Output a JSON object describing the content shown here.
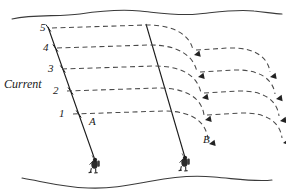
{
  "figure": {
    "current_label": "Current",
    "line_a_label": "A",
    "line_b_label": "B",
    "depth_marks": [
      {
        "label": "5",
        "x": 40,
        "y": 22
      },
      {
        "label": "4",
        "x": 43,
        "y": 42
      },
      {
        "label": "3",
        "x": 48,
        "y": 63
      },
      {
        "label": "2",
        "x": 53,
        "y": 85
      },
      {
        "label": "1",
        "x": 59,
        "y": 108
      }
    ],
    "label_positions": {
      "current": {
        "x": 4,
        "y": 78
      },
      "line_a": {
        "x": 89,
        "y": 116
      },
      "line_b": {
        "x": 203,
        "y": 134
      }
    },
    "colors": {
      "ink": "#1a1a1a",
      "dash": "#4a4a4a",
      "surface": "#3a3a3a",
      "seabed": "#3a3a3a",
      "background": "#ffffff"
    },
    "geometry": {
      "surface_wave_path": "M 12 19 C 35 14, 58 17, 80 14 C 100 11, 118 9, 140 11 C 160 13, 178 16, 198 14 C 218 12, 236 9, 254 11 C 266 12, 274 14, 282 14",
      "seabed_wave_path": "M 22 178 C 45 182, 62 187, 88 188 C 112 189, 130 185, 152 181 C 172 177, 192 175, 214 177 C 238 179, 256 182, 272 180",
      "line_a": {
        "x1": 48,
        "y1": 27,
        "x2": 96,
        "y2": 163
      },
      "line_b": {
        "x1": 146,
        "y1": 24,
        "x2": 186,
        "y2": 161
      },
      "flow_lines": [
        {
          "name": "flow-5",
          "start_y": 28,
          "path": "M 52 28 L 146 25 C 176 25, 190 36, 193 50",
          "arrow": {
            "x": 194,
            "y": 55,
            "angle": 78
          },
          "tail_path": "M 196 50 L 228 48 C 256 47, 268 58, 270 72",
          "tail_arrow": {
            "x": 270,
            "y": 77,
            "angle": 80
          }
        },
        {
          "name": "flow-4",
          "start_y": 48,
          "path": "M 57 48 L 150 45 C 180 45, 194 57, 197 72",
          "arrow": {
            "x": 198,
            "y": 77,
            "angle": 79
          },
          "tail_path": "M 200 72 L 233 70 C 261 69, 273 80, 275 94",
          "tail_arrow": {
            "x": 276,
            "y": 99,
            "angle": 81
          }
        },
        {
          "name": "flow-3",
          "start_y": 69,
          "path": "M 62 69 L 155 66 C 185 66, 198 78, 201 93",
          "arrow": {
            "x": 202,
            "y": 98,
            "angle": 79
          },
          "tail_path": "M 204 93 L 237 91 C 265 90, 277 101, 279 116",
          "tail_arrow": {
            "x": 280,
            "y": 121,
            "angle": 81
          }
        },
        {
          "name": "flow-2",
          "start_y": 91,
          "path": "M 67 91 L 159 88 C 189 88, 202 100, 204 115",
          "arrow": {
            "x": 205,
            "y": 120,
            "angle": 79
          },
          "tail_path": "M 207 115 L 240 113 C 268 112, 280 123, 282 138",
          "tail_arrow": {
            "x": 283,
            "y": 143,
            "angle": 81
          }
        },
        {
          "name": "flow-1",
          "start_y": 114,
          "path": "M 73 114 L 164 111 C 194 111, 206 123, 208 139",
          "arrow": {
            "x": 209,
            "y": 144,
            "angle": 80
          },
          "tail_path": "",
          "tail_arrow": null
        }
      ],
      "divers": [
        {
          "name": "diver-a",
          "x": 96,
          "y": 163
        },
        {
          "name": "diver-b",
          "x": 186,
          "y": 161
        }
      ]
    }
  }
}
